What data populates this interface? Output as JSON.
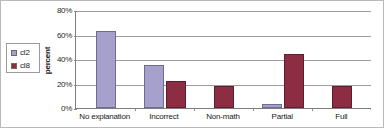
{
  "chart_data": {
    "type": "bar",
    "title": "",
    "subtitle": "",
    "xlabel": "",
    "ylabel": "percent",
    "ylim": [
      0,
      80
    ],
    "ytick_labels": [
      "0%",
      "20%",
      "40%",
      "60%",
      "80%"
    ],
    "ytick_values": [
      0,
      20,
      40,
      60,
      80
    ],
    "grid": true,
    "legend_position": "left-outside",
    "categories": [
      "No explanation",
      "Incorrect",
      "Non-math",
      "Partial",
      "Full"
    ],
    "series": [
      {
        "name": "cl2",
        "color": "#a5a0cc",
        "values": [
          63,
          35,
          0,
          3,
          0
        ]
      },
      {
        "name": "cl8",
        "color": "#8c2d44",
        "values": [
          0,
          22,
          18,
          44,
          18
        ]
      }
    ]
  },
  "legend": {
    "entries": [
      {
        "label": "cl2",
        "swatch": "legend-swatch-cl2"
      },
      {
        "label": "cl8",
        "swatch": "legend-swatch-cl8"
      }
    ]
  },
  "axes": {
    "y_title": "percent"
  }
}
